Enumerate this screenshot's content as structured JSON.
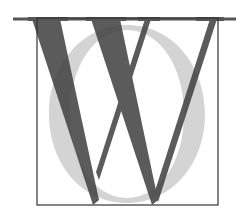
{
  "figure": {
    "letters": [
      "W",
      "O"
    ],
    "colors": {
      "w_fill": "#4a4a4a",
      "o_fill": "#cfcfcf",
      "box_stroke": "#333333",
      "rule": "#555555",
      "background": "#ffffff"
    }
  }
}
